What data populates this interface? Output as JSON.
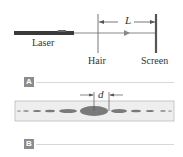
{
  "panel_a": {
    "badge": "A",
    "labels": {
      "laser": "Laser",
      "hair": "Hair",
      "screen": "Screen",
      "distance": "L"
    }
  },
  "panel_b": {
    "badge": "B",
    "labels": {
      "spacing": "d"
    }
  },
  "colors": {
    "laser_body": "#3a3a3a",
    "beam": "#888888",
    "screen": "#555555",
    "pattern_bg": "#eeeeee",
    "fringe": "#7a7a7a",
    "badge": "#8c8c8c"
  }
}
